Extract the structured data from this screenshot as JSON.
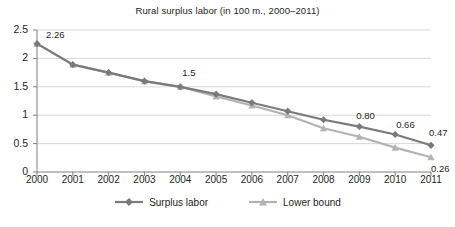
{
  "chart_data": {
    "type": "line",
    "title": "Rural surplus labor (in 100 m., 2000–2011)",
    "xlabel": "",
    "ylabel": "",
    "categories": [
      "2000",
      "2001",
      "2002",
      "2003",
      "2004",
      "2005",
      "2006",
      "2007",
      "2008",
      "2009",
      "2010",
      "2011"
    ],
    "ylim": [
      0,
      2.5
    ],
    "yticks": [
      "0",
      "0.5",
      "1",
      "1.5",
      "2",
      "2.5"
    ],
    "ytick_values": [
      0,
      0.5,
      1,
      1.5,
      2,
      2.5
    ],
    "grid": true,
    "legend_position": "bottom",
    "series": [
      {
        "name": "Surplus labor",
        "color": "#7a7a7a",
        "marker": "diamond",
        "values": [
          2.26,
          1.89,
          1.75,
          1.6,
          1.5,
          1.37,
          1.22,
          1.07,
          0.92,
          0.8,
          0.66,
          0.47
        ]
      },
      {
        "name": "Lower bound",
        "color": "#b3b3b3",
        "marker": "triangle",
        "values": [
          2.26,
          1.89,
          1.75,
          1.6,
          1.5,
          1.33,
          1.17,
          1.0,
          0.77,
          0.62,
          0.43,
          0.26
        ]
      }
    ],
    "annotations": [
      {
        "text": "2.26",
        "series": "Surplus labor",
        "category": "2000"
      },
      {
        "text": "1.5",
        "series": "Surplus labor",
        "category": "2004"
      },
      {
        "text": "0.80",
        "series": "Surplus labor",
        "category": "2009"
      },
      {
        "text": "0.66",
        "series": "Surplus labor",
        "category": "2010"
      },
      {
        "text": "0.47",
        "series": "Surplus labor",
        "category": "2011"
      },
      {
        "text": "0.26",
        "series": "Lower bound",
        "category": "2011"
      }
    ]
  },
  "colors": {
    "surplus_labor": "#7a7a7a",
    "lower_bound": "#b3b3b3",
    "grid": "#d9d9d9",
    "axis": "#808080",
    "text": "#231f20",
    "background": "#ffffff"
  }
}
